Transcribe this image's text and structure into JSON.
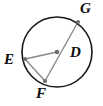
{
  "figure": {
    "name": "circle-with-center-D",
    "canvas": {
      "width": 103,
      "height": 106
    },
    "background_color": "#ffffff"
  },
  "style": {
    "circle_stroke_color": "#1a1a1a",
    "circle_stroke_width": 1.6,
    "segment_stroke_color": "#8a8a8a",
    "segment_stroke_width": 1.4,
    "point_fill_color": "#6e6e6e",
    "point_radius": 2.1,
    "label_color": "#0d0d0d",
    "label_font_size": 15
  },
  "circle": {
    "name": "main-circle",
    "center_x": 57,
    "center_y": 52,
    "radius": 35
  },
  "points": [
    {
      "id": "G",
      "label": "G",
      "x": 78,
      "y": 22,
      "on_circle": true,
      "label_x": 80,
      "label_y": 1
    },
    {
      "id": "E",
      "label": "E",
      "x": 25,
      "y": 59,
      "on_circle": true,
      "label_x": 4,
      "label_y": 52
    },
    {
      "id": "D",
      "label": "D",
      "x": 57,
      "y": 52,
      "on_circle": false,
      "label_x": 70,
      "label_y": 45,
      "is_center": true
    },
    {
      "id": "F",
      "label": "F",
      "x": 45,
      "y": 81,
      "on_circle": true,
      "label_x": 36,
      "label_y": 86
    }
  ],
  "segments": [
    {
      "id": "FG",
      "name": "chord-F-to-G-through-center",
      "from": "F",
      "to": "G",
      "x1": 45,
      "y1": 81,
      "x2": 78,
      "y2": 22
    },
    {
      "id": "DE",
      "name": "radius-D-to-E",
      "from": "D",
      "to": "E",
      "x1": 57,
      "y1": 52,
      "x2": 25,
      "y2": 59
    },
    {
      "id": "EF",
      "name": "chord-E-to-F",
      "from": "E",
      "to": "F",
      "x1": 25,
      "y1": 59,
      "x2": 45,
      "y2": 81
    }
  ]
}
